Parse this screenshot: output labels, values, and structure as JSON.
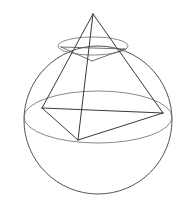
{
  "figure": {
    "title": "Tetrahedron inscribed in a sphere",
    "background_color": "#ffffff",
    "line_color": "#3a3a3a",
    "faint_line_color": "#7a7a7a",
    "canvas": {
      "width": 180,
      "height": 212
    }
  },
  "chart_data": {
    "type": "diagram",
    "title": "Tetrahedron inscribed in a sphere",
    "projection": "oblique-perspective",
    "sphere": {
      "name": "circumscribed-sphere",
      "center": [
        98,
        120
      ],
      "radius": 74,
      "stroke": "#4a4a4a"
    },
    "equator_ellipse": {
      "name": "equator-great-circle",
      "center": [
        98,
        117
      ],
      "rx": 74,
      "ry": 26,
      "stroke": "#6b6b6b"
    },
    "upper_latitude_ellipse": {
      "name": "upper-latitude-circle",
      "center": [
        93,
        46
      ],
      "rx": 35,
      "ry": 9,
      "stroke": "#6b6b6b"
    },
    "vertices": [
      {
        "id": "apex",
        "label": "apex",
        "x": 93,
        "y": 14
      },
      {
        "id": "base-left",
        "label": "base left vertex",
        "x": 42,
        "y": 108
      },
      {
        "id": "base-right",
        "label": "base right vertex",
        "x": 163,
        "y": 113
      },
      {
        "id": "base-front",
        "label": "base front vertex",
        "x": 78,
        "y": 140
      }
    ],
    "inner_vertices": [
      {
        "id": "upper-left",
        "label": "upper ring left",
        "x": 61,
        "y": 47
      },
      {
        "id": "upper-right",
        "label": "upper ring right",
        "x": 125,
        "y": 49
      },
      {
        "id": "upper-front",
        "label": "upper ring front",
        "x": 92,
        "y": 61
      }
    ],
    "edges": [
      {
        "from": "apex",
        "to": "base-left",
        "kind": "lateral"
      },
      {
        "from": "apex",
        "to": "base-right",
        "kind": "lateral"
      },
      {
        "from": "apex",
        "to": "base-front",
        "kind": "lateral"
      },
      {
        "from": "base-left",
        "to": "base-right",
        "kind": "base"
      },
      {
        "from": "base-left",
        "to": "base-front",
        "kind": "base"
      },
      {
        "from": "base-front",
        "to": "base-right",
        "kind": "base"
      }
    ],
    "inner_edges": [
      {
        "from": "upper-left",
        "to": "upper-right",
        "kind": "inner-chord"
      },
      {
        "from": "upper-left",
        "to": "upper-front",
        "kind": "inner-chord"
      },
      {
        "from": "upper-front",
        "to": "upper-right",
        "kind": "inner-chord"
      }
    ],
    "xlabel": "",
    "ylabel": "",
    "legend": [],
    "annotations": []
  }
}
